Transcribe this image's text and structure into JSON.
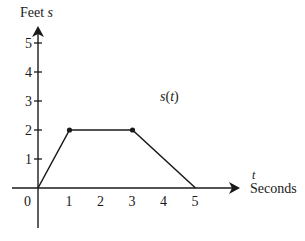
{
  "chart_data": {
    "type": "line",
    "title": "",
    "xlabel": "Seconds",
    "xlabel_var": "t",
    "ylabel": "Feet",
    "ylabel_var": "s",
    "series": [
      {
        "name": "s(t)",
        "x": [
          0,
          1,
          3,
          5
        ],
        "values": [
          0,
          2,
          2,
          0
        ],
        "markers_at": [
          1,
          3
        ]
      }
    ],
    "x_ticks": [
      "0",
      "1",
      "2",
      "3",
      "4",
      "5"
    ],
    "y_ticks": [
      "1",
      "2",
      "3",
      "4",
      "5"
    ],
    "xlim": [
      0,
      5
    ],
    "ylim": [
      0,
      5
    ],
    "grid": false,
    "legend": "none",
    "annotations": [
      "s(t)"
    ]
  },
  "labels": {
    "y_axis_title": "Feet",
    "y_axis_var": "s",
    "x_axis_var": "t",
    "x_axis_title": "Seconds",
    "curve_label_fn": "s",
    "curve_label_arg": "t",
    "origin": "0"
  },
  "colors": {
    "line": "#1a1a1a",
    "background": "#ffffff"
  }
}
